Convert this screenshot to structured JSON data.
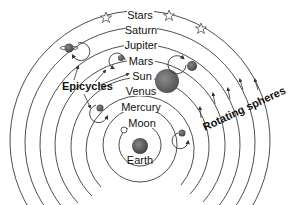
{
  "diagram": {
    "center": {
      "x": 140,
      "y": 145
    },
    "spheres": [
      {
        "label": "Moon",
        "radius": 21
      },
      {
        "label": "Mercury",
        "radius": 37
      },
      {
        "label": "Venus",
        "radius": 54
      },
      {
        "label": "Sun",
        "radius": 69
      },
      {
        "label": "Mars",
        "radius": 85
      },
      {
        "label": "Jupiter",
        "radius": 100
      },
      {
        "label": "Saturn",
        "radius": 115
      },
      {
        "label": "Stars",
        "radius": 130
      }
    ],
    "earth_label": "Earth",
    "epicycles_label": "Epicycles",
    "rotating_label": "Rotating spheres",
    "colors": {
      "planet": "#5a5a5a",
      "sun": "#6a6a6a",
      "earth": "#444444",
      "line": "#3a3a3a"
    }
  }
}
